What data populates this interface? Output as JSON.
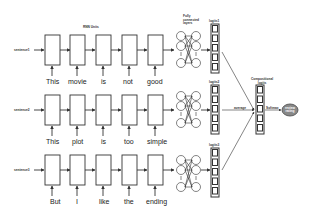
{
  "labels": {
    "rnn_units": "RNN Units",
    "fully_connected": "Fully connected layers",
    "compositional_logits": "Compositional logits",
    "average": "average",
    "softmax": "Softmax",
    "output": "review rating"
  },
  "sentences": [
    {
      "name": "sentence1",
      "logits_label": "logits1",
      "words": [
        "This",
        "movie",
        "is",
        "not",
        "good"
      ]
    },
    {
      "name": "sentence2",
      "logits_label": "logits2",
      "words": [
        "This",
        "plot",
        "is",
        "too",
        "simple"
      ]
    },
    {
      "name": "sentence3",
      "logits_label": "logits3",
      "words": [
        "But",
        "I",
        "like",
        "the",
        "ending"
      ]
    }
  ]
}
